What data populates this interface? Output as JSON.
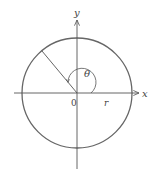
{
  "diagram": {
    "type": "polar-coordinate-circle",
    "labels": {
      "x_axis": "x",
      "y_axis": "y",
      "origin": "0",
      "radius": "r",
      "angle": "θ"
    },
    "colors": {
      "stroke": "#555555",
      "circle": "#666666",
      "text": "#444444"
    },
    "geometry": {
      "center": [
        77,
        93
      ],
      "radius_px": 55,
      "radius_line_angle_deg": 130
    }
  }
}
